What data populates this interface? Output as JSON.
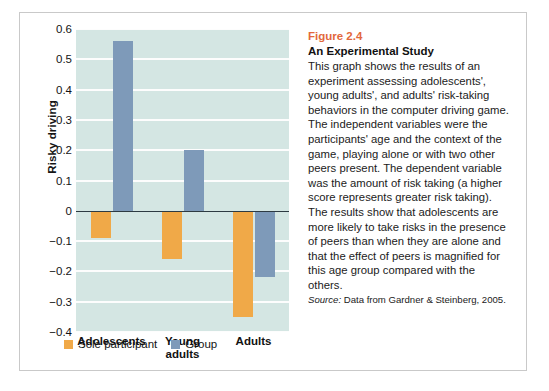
{
  "figure": {
    "number": "Figure 2.4",
    "title": "An Experimental Study",
    "body": "This graph shows the results of an experiment assessing adolescents', young adults', and adults' risk-taking behaviors in the computer driving game. The independent variables were the participants' age and the context of the game, playing alone or with two other peers present. The dependent variable was the amount of risk taking (a higher score represents greater risk taking). The results show that adolescents are more likely to take risks in the presence of peers than when they are alone and that the effect of peers is magnified for this age group compared with the others.",
    "source_label": "Source:",
    "source_text": " Data from Gardner & Steinberg, 2005."
  },
  "colors": {
    "sole_participant": "#f0a948",
    "group": "#7e9ab9",
    "plot_background": "#d4e6e3",
    "gridline": "#fdfdfd",
    "zero_axis": "#2d3a42",
    "figure_number": "#e2683c"
  },
  "chart_data": {
    "type": "bar",
    "title": "",
    "xlabel": "",
    "ylabel": "Risky driving",
    "categories": [
      "Adolescents",
      "Young adults",
      "Adults"
    ],
    "series": [
      {
        "name": "Sole participant",
        "color": "#f0a948",
        "values": [
          -0.09,
          -0.16,
          -0.35
        ]
      },
      {
        "name": "Group",
        "color": "#7e9ab9",
        "values": [
          0.56,
          0.2,
          -0.22
        ]
      }
    ],
    "ylim": [
      -0.4,
      0.6
    ],
    "ytick_values": [
      0.6,
      0.5,
      0.4,
      0.3,
      0.2,
      0.1,
      0,
      -0.1,
      -0.2,
      -0.3,
      -0.4
    ],
    "ytick_labels": [
      "0.6",
      "0.5",
      "0.4",
      "0.3",
      "0.2",
      "0.1",
      "0",
      "−0.1",
      "−0.2",
      "−0.3",
      "−0.4"
    ],
    "grid": true,
    "legend_position": "bottom-left"
  }
}
